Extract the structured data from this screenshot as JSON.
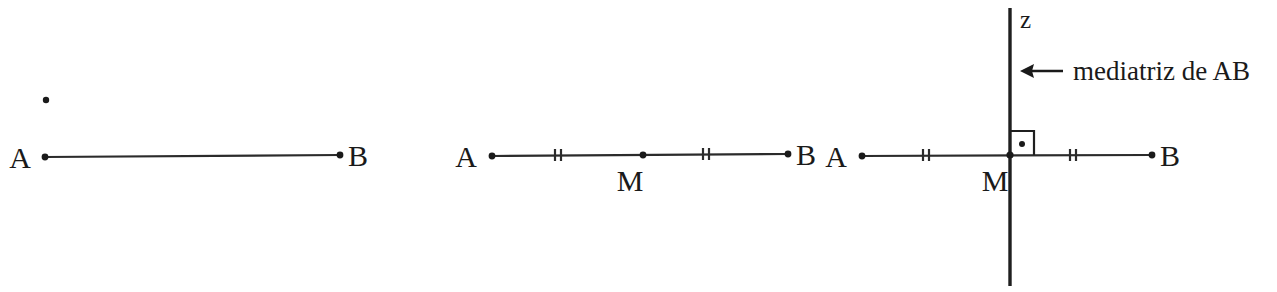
{
  "figure": {
    "background_color": "#ffffff",
    "ink_color": "#1a1a1a",
    "panels": [
      {
        "id": "panel-segment",
        "labels": {
          "point_a": "A",
          "point_b": "B"
        },
        "geometry": {
          "a_x": 45,
          "a_y": 157,
          "b_x": 340,
          "b_y": 155,
          "stray_dot_x": 46,
          "stray_dot_y": 100
        },
        "label_positions": {
          "a_label_x": 20,
          "a_label_y": 168,
          "b_label_x": 348,
          "b_label_y": 166
        }
      },
      {
        "id": "panel-midpoint",
        "labels": {
          "point_a": "A",
          "point_b": "B",
          "midpoint": "M"
        },
        "geometry": {
          "a_x": 492,
          "a_y": 156,
          "b_x": 788,
          "b_y": 154,
          "m_x": 643,
          "m_y": 155,
          "tick_left_x": 557,
          "tick_right_x": 705,
          "tick_half_height": 6,
          "tick_gap": 4
        },
        "label_positions": {
          "a_label_x": 466,
          "a_label_y": 167,
          "b_label_x": 796,
          "b_label_y": 165,
          "m_label_x": 617,
          "m_label_y": 191
        }
      },
      {
        "id": "panel-perpendicular-bisector",
        "labels": {
          "point_a": "A",
          "point_b": "B",
          "midpoint": "M",
          "line_name": "z",
          "annotation": "mediatriz de AB",
          "arrow_icon": "left-arrow-icon"
        },
        "geometry": {
          "a_x": 862,
          "a_y": 156,
          "b_x": 1152,
          "b_y": 155,
          "m_x": 1010,
          "m_y": 155,
          "tick_left_x": 925,
          "tick_right_x": 1072,
          "tick_half_height": 6,
          "tick_gap": 4,
          "vline_x": 1010,
          "vline_top_y": 8,
          "vline_bottom_y": 286,
          "right_angle_size": 24,
          "right_angle_dot_x": 1022,
          "right_angle_dot_y": 144
        },
        "label_positions": {
          "a_label_x": 836,
          "a_label_y": 167,
          "b_label_x": 1160,
          "b_label_y": 166,
          "m_label_x": 982,
          "m_label_y": 191,
          "z_label_x": 1020,
          "z_label_y": 28,
          "arrow_x1": 1063,
          "arrow_x2": 1022,
          "arrow_y": 71,
          "annotation_x": 1073,
          "annotation_y": 80
        }
      }
    ]
  }
}
